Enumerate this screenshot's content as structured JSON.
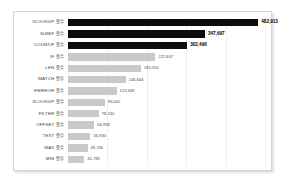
{
  "chart_data": {
    "type": "bar",
    "orientation": "horizontal",
    "title": "",
    "subtitle": "",
    "xlabel": "",
    "ylabel": "",
    "grid": true,
    "legend": false,
    "xlim": [
      0,
      500000
    ],
    "gridline_values": [
      0,
      100000,
      200000,
      300000,
      400000,
      500000
    ],
    "categories": [
      "VLOOKUP 함수",
      "SUMIF 함수",
      "COUNTIF 함수",
      "IF 함수",
      "LEN 함수",
      "MATCH 함수",
      "IFERROR 함수",
      "XLOOKUP 함수",
      "FILTER 함수",
      "OFFSET 함수",
      "TEXT 함수",
      "MAX 함수",
      "MIN 함수"
    ],
    "values": [
      482913,
      347697,
      302496,
      221847,
      185555,
      146644,
      123349,
      93045,
      78240,
      66939,
      56930,
      49746,
      41782
    ],
    "value_labels": [
      "482,913",
      "347,697",
      "302,496",
      "221,847",
      "185,555",
      "146,644",
      "123,349",
      "93,045",
      "78,240",
      "66,939",
      "56,930",
      "49,746",
      "41,782"
    ],
    "highlighted": [
      true,
      true,
      true,
      false,
      false,
      false,
      false,
      false,
      false,
      false,
      false,
      false,
      false
    ],
    "colors": {
      "highlight_bar": "#0d0d0d",
      "default_bar": "#c9c9c9",
      "gridline": "#f0f0f0",
      "frame_border": "#d4d4d4",
      "label_text": "#3a3a3a",
      "value_text": "#4a4a4a",
      "background": "#ffffff"
    }
  }
}
